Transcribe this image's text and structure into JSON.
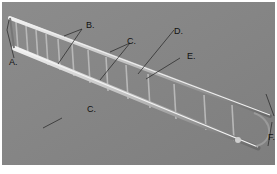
{
  "figure": {
    "background_color": "#8a8a8a",
    "labels": [
      {
        "id": "A",
        "text": "A."
      },
      {
        "id": "B",
        "text": "B."
      },
      {
        "id": "C1",
        "text": "C."
      },
      {
        "id": "C2",
        "text": "C."
      },
      {
        "id": "D",
        "text": "D."
      },
      {
        "id": "E",
        "text": "E."
      },
      {
        "id": "F",
        "text": "F."
      }
    ]
  }
}
